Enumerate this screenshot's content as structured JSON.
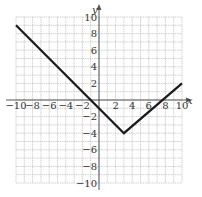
{
  "chart_data": {
    "type": "line",
    "title": "",
    "xlabel": "x",
    "ylabel": "y",
    "xlim": [
      -10,
      10
    ],
    "ylim": [
      -10,
      10
    ],
    "grid": true,
    "grid_step": 1,
    "x_tick_labels": [
      "-10",
      "-8",
      "-6",
      "-4",
      "-2",
      "2",
      "4",
      "6",
      "8",
      "10"
    ],
    "y_tick_labels": [
      "10",
      "8",
      "6",
      "4",
      "2",
      "-2",
      "-4",
      "-6",
      "-8",
      "-10"
    ],
    "series": [
      {
        "name": "piecewise absolute value graph",
        "points": [
          [
            -10,
            9
          ],
          [
            3,
            -4
          ],
          [
            10,
            2
          ]
        ]
      }
    ],
    "vertex": [
      3,
      -4
    ],
    "colors": {
      "line": "#1a1a1a",
      "grid": "#b0b0b0",
      "axis": "#555555"
    }
  }
}
